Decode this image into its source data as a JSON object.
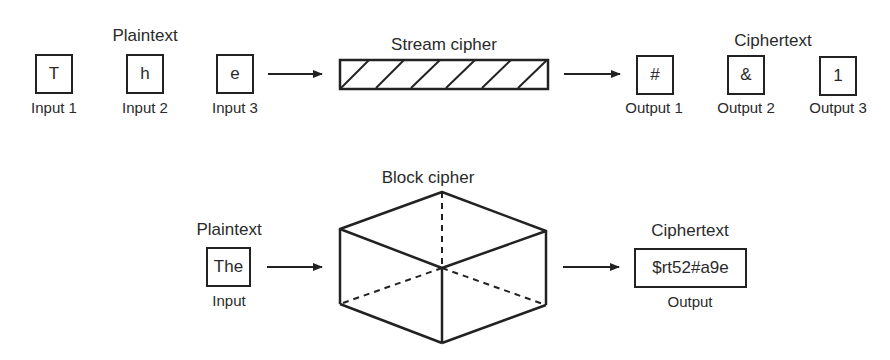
{
  "stream": {
    "plaintext_title": "Plaintext",
    "cipher_title": "Stream cipher",
    "ciphertext_title": "Ciphertext",
    "inputs": [
      {
        "char": "T",
        "label": "Input 1"
      },
      {
        "char": "h",
        "label": "Input 2"
      },
      {
        "char": "e",
        "label": "Input 3"
      }
    ],
    "outputs": [
      {
        "char": "#",
        "label": "Output 1"
      },
      {
        "char": "&",
        "label": "Output 2"
      },
      {
        "char": "1",
        "label": "Output 3"
      }
    ]
  },
  "block": {
    "plaintext_title": "Plaintext",
    "cipher_title": "Block cipher",
    "ciphertext_title": "Ciphertext",
    "input": {
      "text": "The",
      "label": "Input"
    },
    "output": {
      "text": "$rt52#a9e",
      "label": "Output"
    }
  },
  "colors": {
    "stroke": "#222222",
    "text": "#2a2a2a",
    "background": "#ffffff"
  }
}
